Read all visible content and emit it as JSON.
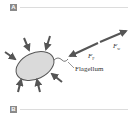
{
  "panels": [
    {
      "label": "A"
    },
    {
      "label": "B"
    }
  ],
  "diagram": {
    "labels": {
      "flagellum": "Flagellum",
      "force_f": "F",
      "force_f_sub": "F",
      "force_w": "F",
      "force_w_sub": "w"
    },
    "colors": {
      "arrow": "#555555",
      "body_fill": "#d8d8d8",
      "body_stroke": "#555555",
      "panel_label_bg": "#8a8a8a",
      "rule": "#dcdcdc"
    }
  }
}
